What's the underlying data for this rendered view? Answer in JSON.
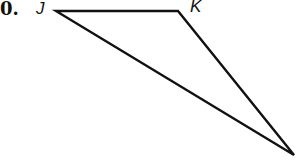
{
  "problem": {
    "number": "0."
  },
  "figure": {
    "type": "triangle",
    "vertices": [
      {
        "label": "J",
        "x": 56,
        "y": 11
      },
      {
        "label": "K",
        "x": 178,
        "y": 11
      },
      {
        "label": "",
        "x": 294,
        "y": 155
      }
    ],
    "stroke_color": "#111111",
    "stroke_width": 2.4
  }
}
